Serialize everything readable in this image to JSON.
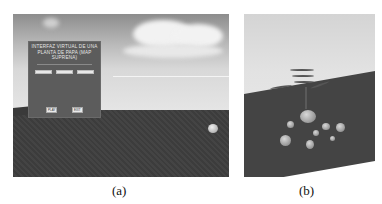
{
  "figures": [
    {
      "id": "a",
      "caption": "(a)",
      "panel": {
        "title_line1": "INTERFAZ VIRTUAL DE UNA",
        "title_line2": "PLANTA DE PAPA (MAP SUPRENA)",
        "fields": [
          {
            "label": "",
            "value": ""
          },
          {
            "label": "",
            "value": ""
          },
          {
            "label": "",
            "value": ""
          }
        ],
        "buttons": [
          "PLAY",
          "EXIT"
        ]
      }
    },
    {
      "id": "b",
      "caption": "(b)"
    }
  ]
}
